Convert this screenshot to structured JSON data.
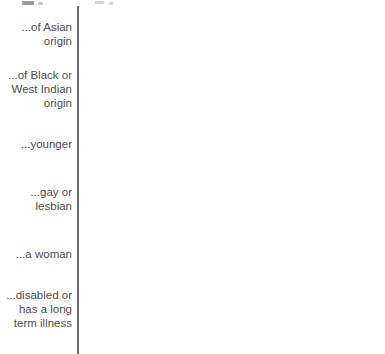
{
  "chart_data": {
    "type": "bar",
    "orientation": "horizontal",
    "title": "",
    "subtitle": "",
    "xlabel": "",
    "ylabel": "",
    "xlim": [
      0,
      100
    ],
    "grid": false,
    "legend": "none",
    "value_suffix": "%",
    "categories": [
      "...of Asian\norigin",
      "...of Black or\nWest Indian\norigin",
      "...younger",
      "...gay or\nlesbian",
      "...a woman",
      "...disabled or\nhas a long\nterm illness"
    ],
    "series": [
      {
        "name": "series-1",
        "values": [
          91,
          92,
          83,
          90,
          94,
          90
        ],
        "labels": [
          "91%",
          "92%",
          "83%",
          "90%",
          "94%",
          "90%"
        ]
      },
      {
        "name": "series-2",
        "values": [
          73,
          74,
          63,
          78,
          86,
          77
        ],
        "labels": [
          "73%",
          "74%",
          "63%",
          "78%",
          "86%",
          "77%"
        ]
      }
    ],
    "colors": {
      "bar": "#4b4b4b",
      "bar_border": "#3a3a3a",
      "value_text": "#ffffff",
      "category_text": "#4f4f4f",
      "axis_line": "#6f6f6f",
      "background": "#ffffff"
    }
  },
  "groups": [
    {
      "label": "...of Asian\norigin",
      "bars": [
        {
          "label": "91%",
          "value": 91
        },
        {
          "label": "73%",
          "value": 73
        }
      ]
    },
    {
      "label": "...of Black or\nWest Indian\norigin",
      "bars": [
        {
          "label": "92%",
          "value": 92
        },
        {
          "label": "74%",
          "value": 74
        }
      ]
    },
    {
      "label": "...younger",
      "bars": [
        {
          "label": "83%",
          "value": 83
        },
        {
          "label": "63%",
          "value": 63
        }
      ]
    },
    {
      "label": "...gay or\nlesbian",
      "bars": [
        {
          "label": "90%",
          "value": 90
        },
        {
          "label": "78%",
          "value": 78
        }
      ]
    },
    {
      "label": "...a woman",
      "bars": [
        {
          "label": "94%",
          "value": 94
        },
        {
          "label": "86%",
          "value": 86
        }
      ]
    },
    {
      "label": "...disabled or\nhas a long\nterm illness",
      "bars": [
        {
          "label": "90%",
          "value": 90
        },
        {
          "label": "77%",
          "value": 77
        }
      ]
    }
  ],
  "layout": {
    "axis_x": 77,
    "bar_origin_x": 78,
    "bar_height": 22,
    "bar_gap": 1,
    "group_gap": 10,
    "first_group_top": 11,
    "scale_px_per_unit": 3.14
  }
}
